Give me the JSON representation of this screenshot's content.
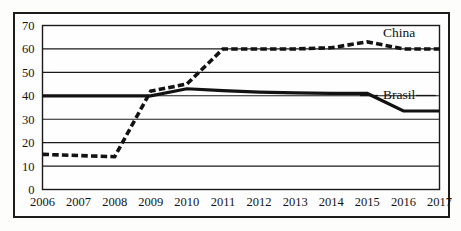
{
  "chart_data": {
    "type": "line",
    "title": "",
    "subtitle": "",
    "xlabel": "",
    "ylabel": "",
    "x": [
      2006,
      2007,
      2008,
      2009,
      2010,
      2011,
      2012,
      2013,
      2014,
      2015,
      2016,
      2017
    ],
    "categories": [
      "2006",
      "2007",
      "2008",
      "2009",
      "2010",
      "2011",
      "2012",
      "2013",
      "2014",
      "2015",
      "2016",
      "2017"
    ],
    "xlim": [
      2006,
      2017
    ],
    "ylim": [
      0,
      70
    ],
    "yticks": [
      0,
      10,
      20,
      30,
      40,
      50,
      60,
      70
    ],
    "ytick_labels": [
      "0",
      "10",
      "20",
      "30",
      "40",
      "50",
      "60",
      "70"
    ],
    "grid": true,
    "grid_axis": "y",
    "legend_position": "inline-right-annotations",
    "series": [
      {
        "name": "China",
        "style": "dashed",
        "color": "#121212",
        "label_text": "China",
        "values": [
          15,
          14.5,
          14,
          42,
          45,
          60,
          60,
          60,
          60.5,
          63,
          60,
          60
        ]
      },
      {
        "name": "Brasil",
        "style": "solid",
        "color": "#121212",
        "label_text": "Brasil",
        "values": [
          40,
          40,
          40,
          40,
          43,
          42.2,
          41.6,
          41.2,
          41,
          41,
          33.5,
          33.5
        ]
      }
    ],
    "annotations": [
      {
        "text": "China",
        "series": "China",
        "near_x": 2016
      },
      {
        "text": "Brasil",
        "series": "Brasil",
        "near_x": 2016
      }
    ]
  },
  "figure": {
    "background_color": "#fdfdfb",
    "frame_color": "#1c1c1c",
    "line_color": "#121212"
  }
}
